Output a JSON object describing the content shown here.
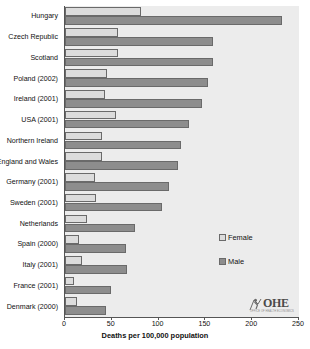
{
  "chart_data": {
    "type": "bar",
    "orientation": "horizontal",
    "title": "",
    "xlabel": "Deaths per 100,000 population",
    "ylabel": "",
    "xlim": [
      0,
      250
    ],
    "xticks": [
      0,
      50,
      100,
      150,
      200,
      250
    ],
    "grid": false,
    "legend_position": "center-right",
    "categories": [
      "Hungary",
      "Czech Republic",
      "Scotland",
      "Poland (2002)",
      "Ireland (2001)",
      "USA (2001)",
      "Northern Ireland",
      "England and Wales",
      "Germany (2001)",
      "Sweden (2001)",
      "Netherlands",
      "Spain (2000)",
      "Italy (2001)",
      "France (2001)",
      "Denmark (2000)"
    ],
    "series": [
      {
        "name": "Female",
        "color": "#dcdcdc",
        "values": [
          81,
          57,
          57,
          45,
          43,
          55,
          40,
          39,
          32,
          33,
          23,
          15,
          18,
          10,
          13
        ]
      },
      {
        "name": "Male",
        "color": "#8d8d8d",
        "values": [
          232,
          158,
          158,
          153,
          146,
          132,
          124,
          121,
          111,
          104,
          75,
          65,
          66,
          49,
          44
        ]
      }
    ]
  },
  "legend": {
    "items": [
      {
        "label": "Female",
        "swatch": "female"
      },
      {
        "label": "Male",
        "swatch": "male"
      }
    ]
  },
  "logo": {
    "name": "OHE",
    "subtitle": "OFFICE OF HEALTH ECONOMICS"
  },
  "colors": {
    "plot_background": "#ececec",
    "female_bar": "#dcdcdc",
    "male_bar": "#8d8d8d",
    "bar_border": "#6a6a6a",
    "axis": "#555555",
    "text": "#111111"
  }
}
